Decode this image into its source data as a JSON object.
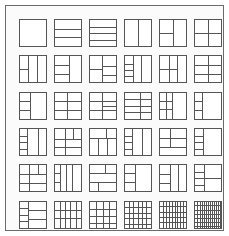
{
  "figure": {
    "rows": 6,
    "columns": 6,
    "tile_count": 36,
    "frame_color": "#6b6b6b",
    "line_color": "#555555",
    "background_color": "#fbfbfb",
    "page_background": "#ffffff"
  },
  "tiles": [
    {
      "id": "r1c1",
      "row": 1,
      "col": 1,
      "name": "empty-square",
      "h_lines": [],
      "v_lines": [],
      "regions": []
    },
    {
      "id": "r1c2",
      "row": 1,
      "col": 2,
      "name": "three-horizontal-bands",
      "h_lines": [
        33,
        66
      ],
      "v_lines": [],
      "regions": []
    },
    {
      "id": "r1c3",
      "row": 1,
      "col": 3,
      "name": "four-horizontal-bands",
      "h_lines": [
        25,
        50,
        75
      ],
      "v_lines": [],
      "regions": []
    },
    {
      "id": "r1c4",
      "row": 1,
      "col": 4,
      "name": "two-vertical-bands",
      "h_lines": [],
      "v_lines": [
        50
      ],
      "regions": []
    },
    {
      "id": "r1c5",
      "row": 1,
      "col": 5,
      "name": "left-column-split-two",
      "h_lines": [],
      "v_lines": [
        50
      ],
      "regions": [
        {
          "x": 0,
          "y": 0,
          "w": 50,
          "h": 100,
          "h_lines": [
            50
          ],
          "v_lines": []
        }
      ]
    },
    {
      "id": "r1c6",
      "row": 1,
      "col": 6,
      "name": "two-by-two-grid",
      "h_lines": [
        50
      ],
      "v_lines": [
        50
      ],
      "regions": []
    },
    {
      "id": "r2c1",
      "row": 2,
      "col": 1,
      "name": "three-columns-left-split",
      "h_lines": [],
      "v_lines": [
        33,
        66
      ],
      "regions": [
        {
          "x": 0,
          "y": 0,
          "w": 33,
          "h": 100,
          "h_lines": [
            50
          ],
          "v_lines": []
        }
      ]
    },
    {
      "id": "r2c2",
      "row": 2,
      "col": 2,
      "name": "left-column-three-rows-right-whole",
      "h_lines": [],
      "v_lines": [
        55
      ],
      "regions": [
        {
          "x": 0,
          "y": 0,
          "w": 55,
          "h": 100,
          "h_lines": [
            33,
            66
          ],
          "v_lines": []
        }
      ]
    },
    {
      "id": "r2c3",
      "row": 2,
      "col": 3,
      "name": "left-two-rows-right-three-rows",
      "h_lines": [],
      "v_lines": [
        45
      ],
      "regions": [
        {
          "x": 0,
          "y": 0,
          "w": 45,
          "h": 100,
          "h_lines": [
            50
          ],
          "v_lines": []
        },
        {
          "x": 45,
          "y": 0,
          "w": 55,
          "h": 100,
          "h_lines": [
            38,
            70
          ],
          "v_lines": []
        }
      ]
    },
    {
      "id": "r2c4",
      "row": 2,
      "col": 4,
      "name": "three-columns-left-four-rows",
      "h_lines": [],
      "v_lines": [
        30,
        62
      ],
      "regions": [
        {
          "x": 0,
          "y": 0,
          "w": 30,
          "h": 100,
          "h_lines": [
            28,
            52,
            76
          ],
          "v_lines": []
        }
      ]
    },
    {
      "id": "r2c5",
      "row": 2,
      "col": 5,
      "name": "three-columns-left-and-middle-split",
      "h_lines": [],
      "v_lines": [
        32,
        64
      ],
      "regions": [
        {
          "x": 0,
          "y": 0,
          "w": 32,
          "h": 100,
          "h_lines": [
            50
          ],
          "v_lines": []
        },
        {
          "x": 32,
          "y": 0,
          "w": 32,
          "h": 100,
          "h_lines": [
            50
          ],
          "v_lines": []
        }
      ]
    },
    {
      "id": "r2c6",
      "row": 2,
      "col": 6,
      "name": "two-columns-three-rows",
      "h_lines": [
        33,
        66
      ],
      "v_lines": [
        50
      ],
      "regions": []
    },
    {
      "id": "r3c1",
      "row": 3,
      "col": 1,
      "name": "left-three-rows-right-open",
      "h_lines": [],
      "v_lines": [
        42
      ],
      "regions": [
        {
          "x": 0,
          "y": 0,
          "w": 42,
          "h": 100,
          "h_lines": [
            33,
            66
          ],
          "v_lines": []
        }
      ]
    },
    {
      "id": "r3c2",
      "row": 3,
      "col": 2,
      "name": "two-columns-mixed-rows",
      "h_lines": [
        33
      ],
      "v_lines": [
        48
      ],
      "regions": [
        {
          "x": 0,
          "y": 33,
          "w": 100,
          "h": 67,
          "h_lines": [
            50
          ],
          "v_lines": []
        }
      ]
    },
    {
      "id": "r3c3",
      "row": 3,
      "col": 3,
      "name": "three-rows-right-subdivided",
      "h_lines": [
        33,
        66
      ],
      "v_lines": [
        45
      ],
      "regions": [
        {
          "x": 45,
          "y": 33,
          "w": 55,
          "h": 33,
          "h_lines": [
            50
          ],
          "v_lines": []
        }
      ]
    },
    {
      "id": "r3c4",
      "row": 3,
      "col": 4,
      "name": "four-rows-two-columns",
      "h_lines": [
        25,
        50,
        75
      ],
      "v_lines": [
        58
      ],
      "regions": []
    },
    {
      "id": "r3c5",
      "row": 3,
      "col": 5,
      "name": "left-blocks-right-open",
      "h_lines": [],
      "v_lines": [
        46
      ],
      "regions": [
        {
          "x": 0,
          "y": 0,
          "w": 46,
          "h": 100,
          "h_lines": [
            30,
            62
          ],
          "v_lines": [
            50
          ]
        }
      ]
    },
    {
      "id": "r3c6",
      "row": 3,
      "col": 6,
      "name": "narrow-left-strip-three-rows",
      "h_lines": [],
      "v_lines": [
        26
      ],
      "regions": [
        {
          "x": 0,
          "y": 0,
          "w": 26,
          "h": 100,
          "h_lines": [
            33,
            66
          ],
          "v_lines": []
        }
      ]
    },
    {
      "id": "r4c1",
      "row": 4,
      "col": 1,
      "name": "left-column-four-rows-right-two",
      "h_lines": [],
      "v_lines": [
        30,
        70
      ],
      "regions": [
        {
          "x": 0,
          "y": 0,
          "w": 30,
          "h": 100,
          "h_lines": [
            25,
            50,
            75
          ],
          "v_lines": []
        }
      ]
    },
    {
      "id": "r4c2",
      "row": 4,
      "col": 2,
      "name": "quadrant-mixed-blocks",
      "h_lines": [
        38,
        70
      ],
      "v_lines": [
        40
      ],
      "regions": [
        {
          "x": 40,
          "y": 0,
          "w": 60,
          "h": 38,
          "h_lines": [],
          "v_lines": [
            50
          ]
        }
      ]
    },
    {
      "id": "r4c3",
      "row": 4,
      "col": 3,
      "name": "top-band-lower-three-columns",
      "h_lines": [
        34
      ],
      "v_lines": [],
      "regions": [
        {
          "x": 0,
          "y": 0,
          "w": 100,
          "h": 34,
          "h_lines": [],
          "v_lines": [
            62
          ]
        },
        {
          "x": 0,
          "y": 34,
          "w": 100,
          "h": 66,
          "h_lines": [],
          "v_lines": [
            32,
            66
          ]
        }
      ]
    },
    {
      "id": "r4c4",
      "row": 4,
      "col": 4,
      "name": "left-narrow-four-rows-right-two-columns",
      "h_lines": [],
      "v_lines": [
        26,
        64
      ],
      "regions": [
        {
          "x": 0,
          "y": 0,
          "w": 26,
          "h": 100,
          "h_lines": [
            25,
            50,
            75
          ],
          "v_lines": []
        }
      ]
    },
    {
      "id": "r4c5",
      "row": 4,
      "col": 5,
      "name": "three-rows-top-split-column",
      "h_lines": [
        34,
        67
      ],
      "v_lines": [],
      "regions": [
        {
          "x": 0,
          "y": 0,
          "w": 100,
          "h": 34,
          "h_lines": [],
          "v_lines": [
            36
          ]
        },
        {
          "x": 0,
          "y": 34,
          "w": 100,
          "h": 33,
          "h_lines": [],
          "v_lines": [
            36
          ]
        }
      ]
    },
    {
      "id": "r4c6",
      "row": 4,
      "col": 6,
      "name": "narrow-left-four-rows-right-open",
      "h_lines": [],
      "v_lines": [
        30
      ],
      "regions": [
        {
          "x": 0,
          "y": 0,
          "w": 30,
          "h": 100,
          "h_lines": [
            25,
            50,
            75
          ],
          "v_lines": []
        }
      ]
    },
    {
      "id": "r5c1",
      "row": 5,
      "col": 1,
      "name": "three-rows-left-column-split",
      "h_lines": [
        33,
        66
      ],
      "v_lines": [
        38
      ],
      "regions": [
        {
          "x": 38,
          "y": 0,
          "w": 62,
          "h": 33,
          "h_lines": [],
          "v_lines": [
            50
          ]
        }
      ]
    },
    {
      "id": "r5c2",
      "row": 5,
      "col": 2,
      "name": "four-columns-narrow",
      "h_lines": [],
      "v_lines": [
        22,
        44,
        66
      ],
      "regions": [
        {
          "x": 0,
          "y": 0,
          "w": 22,
          "h": 100,
          "h_lines": [
            30,
            62
          ],
          "v_lines": []
        }
      ]
    },
    {
      "id": "r5c3",
      "row": 5,
      "col": 3,
      "name": "mixed-blocks-three-rows",
      "h_lines": [
        30,
        64
      ],
      "v_lines": [],
      "regions": [
        {
          "x": 0,
          "y": 0,
          "w": 100,
          "h": 30,
          "h_lines": [],
          "v_lines": [
            58
          ]
        },
        {
          "x": 0,
          "y": 64,
          "w": 100,
          "h": 36,
          "h_lines": [],
          "v_lines": [
            32
          ]
        }
      ]
    },
    {
      "id": "r5c4",
      "row": 5,
      "col": 4,
      "name": "left-three-rows-right-open-tall",
      "h_lines": [],
      "v_lines": [
        38
      ],
      "regions": [
        {
          "x": 0,
          "y": 0,
          "w": 38,
          "h": 100,
          "h_lines": [
            30,
            62
          ],
          "v_lines": []
        }
      ]
    },
    {
      "id": "r5c5",
      "row": 5,
      "col": 5,
      "name": "two-columns-three-rows-left",
      "h_lines": [],
      "v_lines": [
        36,
        68
      ],
      "regions": [
        {
          "x": 0,
          "y": 0,
          "w": 36,
          "h": 100,
          "h_lines": [
            33,
            66
          ],
          "v_lines": []
        }
      ]
    },
    {
      "id": "r5c6",
      "row": 5,
      "col": 6,
      "name": "left-four-rows-right-split",
      "h_lines": [],
      "v_lines": [
        32
      ],
      "regions": [
        {
          "x": 0,
          "y": 0,
          "w": 32,
          "h": 100,
          "h_lines": [
            25,
            50,
            75
          ],
          "v_lines": []
        },
        {
          "x": 32,
          "y": 0,
          "w": 68,
          "h": 100,
          "h_lines": [
            50
          ],
          "v_lines": []
        }
      ]
    },
    {
      "id": "r6c1",
      "row": 6,
      "col": 1,
      "name": "left-four-rows-right-three-rows",
      "h_lines": [],
      "v_lines": [
        34
      ],
      "regions": [
        {
          "x": 0,
          "y": 0,
          "w": 34,
          "h": 100,
          "h_lines": [
            25,
            50,
            75
          ],
          "v_lines": []
        },
        {
          "x": 34,
          "y": 0,
          "w": 66,
          "h": 100,
          "h_lines": [
            33,
            66
          ],
          "v_lines": []
        }
      ]
    },
    {
      "id": "r6c2",
      "row": 6,
      "col": 2,
      "name": "five-columns-rows",
      "h_lines": [
        30,
        62
      ],
      "v_lines": [
        20,
        40,
        60,
        80
      ],
      "regions": []
    },
    {
      "id": "r6c3",
      "row": 6,
      "col": 3,
      "name": "four-columns-three-rows",
      "h_lines": [
        28,
        56,
        80
      ],
      "v_lines": [
        25,
        50,
        75
      ],
      "regions": []
    },
    {
      "id": "r6c4",
      "row": 6,
      "col": 4,
      "name": "six-columns-four-rows",
      "h_lines": [
        20,
        42,
        64,
        84
      ],
      "v_lines": [
        16,
        32,
        48,
        64,
        80
      ],
      "regions": []
    },
    {
      "id": "r6c5",
      "row": 6,
      "col": 5,
      "name": "eight-columns-dense",
      "h_lines": [
        18,
        38,
        58,
        78
      ],
      "v_lines": [
        11,
        22,
        33,
        44,
        55,
        66,
        77,
        88
      ],
      "regions": []
    },
    {
      "id": "r6c6",
      "row": 6,
      "col": 6,
      "name": "twelve-columns-densest",
      "h_lines": [
        14,
        30,
        46,
        62,
        78,
        92
      ],
      "v_lines": [
        8,
        16,
        24,
        32,
        40,
        48,
        56,
        64,
        72,
        80,
        88,
        94
      ],
      "regions": []
    }
  ]
}
